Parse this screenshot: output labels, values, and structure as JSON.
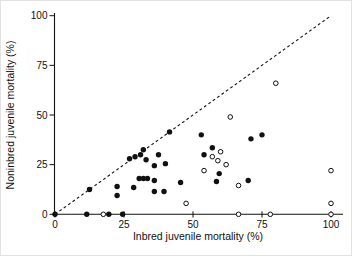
{
  "window": {
    "background": "#ffffff",
    "foreground": "#111111"
  },
  "chart_data": {
    "type": "scatter",
    "title": "",
    "xlabel": "Inbred juvenile mortality (%)",
    "ylabel": "Noninbred juvenile mortality (%)",
    "xlim": [
      0,
      100
    ],
    "ylim": [
      0,
      100
    ],
    "xticks": [
      0,
      25,
      50,
      75,
      100
    ],
    "yticks": [
      0,
      25,
      50,
      75,
      100
    ],
    "grid": false,
    "legend": "none",
    "reference_line": {
      "type": "identity",
      "style": "dashed",
      "color": "#111111",
      "from": [
        0,
        0
      ],
      "to": [
        100,
        100
      ]
    },
    "series": [
      {
        "name": "filled circles",
        "marker": "filled-circle",
        "color": "#111111",
        "points": [
          [
            0,
            0
          ],
          [
            11.5,
            0
          ],
          [
            19.5,
            0
          ],
          [
            24.5,
            0
          ],
          [
            12.5,
            12.5
          ],
          [
            22.5,
            9.5
          ],
          [
            22.5,
            14
          ],
          [
            28.5,
            13.5
          ],
          [
            27,
            28
          ],
          [
            29,
            29
          ],
          [
            31,
            30
          ],
          [
            32,
            32.5
          ],
          [
            33,
            27.5
          ],
          [
            30.5,
            18
          ],
          [
            32,
            18
          ],
          [
            33.5,
            18
          ],
          [
            36,
            24.5
          ],
          [
            36,
            17
          ],
          [
            36,
            11.5
          ],
          [
            37.5,
            30
          ],
          [
            39.5,
            11.5
          ],
          [
            40,
            25.5
          ],
          [
            41.5,
            41.5
          ],
          [
            45.5,
            16
          ],
          [
            53,
            40
          ],
          [
            54,
            30
          ],
          [
            57,
            33.5
          ],
          [
            58.5,
            16.5
          ],
          [
            59.5,
            20.5
          ],
          [
            70,
            17
          ],
          [
            71,
            38
          ],
          [
            75,
            40
          ]
        ]
      },
      {
        "name": "open circles",
        "marker": "open-circle",
        "color": "#111111",
        "fill": "#ffffff",
        "points": [
          [
            17.5,
            0
          ],
          [
            47.5,
            5.5
          ],
          [
            54,
            22
          ],
          [
            57,
            29
          ],
          [
            59,
            27
          ],
          [
            60,
            31.5
          ],
          [
            62,
            25
          ],
          [
            63.5,
            49
          ],
          [
            66.5,
            0
          ],
          [
            66.5,
            14.5
          ],
          [
            78,
            0
          ],
          [
            80,
            66
          ],
          [
            100,
            0
          ],
          [
            100,
            5.5
          ],
          [
            100,
            22
          ]
        ]
      }
    ]
  }
}
